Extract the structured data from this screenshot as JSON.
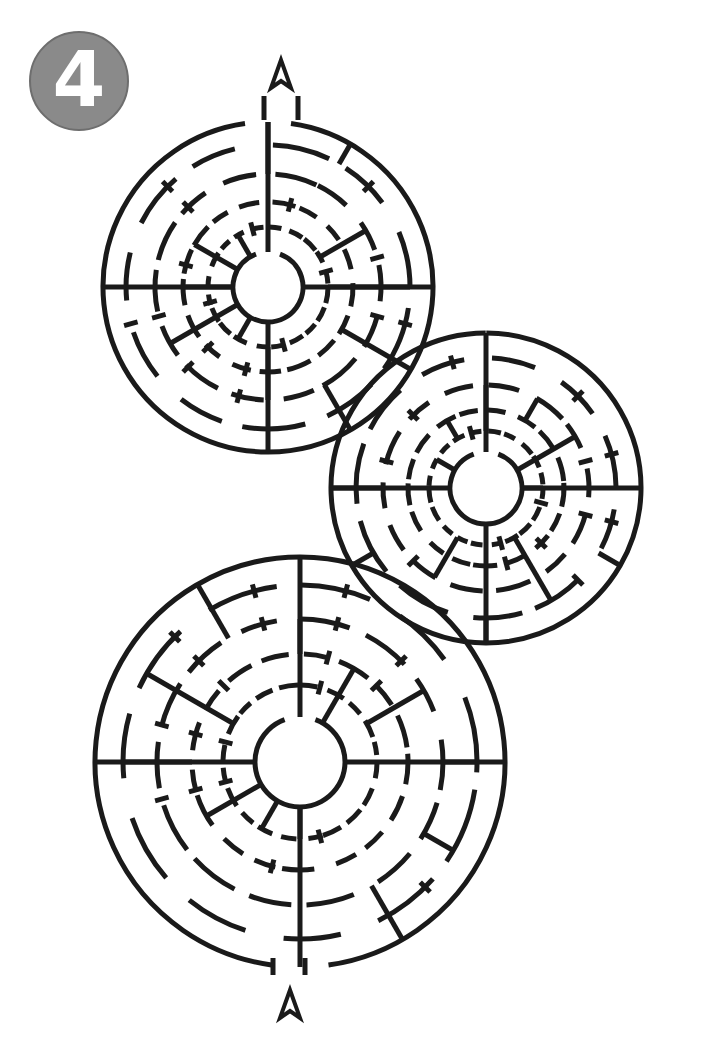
{
  "puzzle": {
    "number_badge": "4",
    "badge_color": "#8a8a8a",
    "type": "circular-maze",
    "stroke_color": "#1a1a1a",
    "entrance_marker": "arrow-up",
    "exit_marker": "arrow-up"
  },
  "mazes": [
    {
      "name": "top-left-maze",
      "cx": 268,
      "cy": 287,
      "rings": [
        165,
        142,
        113,
        85,
        60,
        35
      ]
    },
    {
      "name": "middle-right-maze",
      "cx": 486,
      "cy": 488,
      "rings": [
        155,
        130,
        103,
        78,
        57,
        36
      ]
    },
    {
      "name": "bottom-maze",
      "cx": 300,
      "cy": 762,
      "rings": [
        205,
        177,
        143,
        108,
        77,
        45
      ]
    }
  ]
}
